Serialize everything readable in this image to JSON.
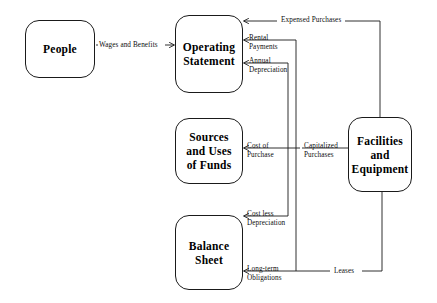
{
  "diagram": {
    "type": "flow-diagram",
    "canvas": {
      "width": 437,
      "height": 303,
      "background": "#ffffff"
    },
    "stroke_color": "#1a1a1a",
    "nodes": [
      {
        "id": "people",
        "lines": [
          "People"
        ],
        "x": 25,
        "y": 20,
        "w": 70,
        "h": 58
      },
      {
        "id": "operating-statement",
        "lines": [
          "Operating",
          "Statement"
        ],
        "x": 175,
        "y": 15,
        "w": 68,
        "h": 78
      },
      {
        "id": "sources-and-uses-of-funds",
        "lines": [
          "Sources",
          "and Uses",
          "of Funds"
        ],
        "x": 175,
        "y": 118,
        "w": 68,
        "h": 66
      },
      {
        "id": "balance-sheet",
        "lines": [
          "Balance",
          "Sheet"
        ],
        "x": 175,
        "y": 215,
        "w": 68,
        "h": 75
      },
      {
        "id": "facilities-and-equipment",
        "lines": [
          "Facilities",
          "and",
          "Equipment"
        ],
        "x": 348,
        "y": 117,
        "w": 64,
        "h": 75
      }
    ],
    "edges": [
      {
        "id": "wages-and-benefits",
        "label_lines": [
          "Wages and Benefits"
        ],
        "from": "people",
        "to": "operating-statement",
        "label_x": 99,
        "label_y": 41,
        "align": "left"
      },
      {
        "id": "expensed-purchases",
        "label_lines": [
          "Expensed Purchases"
        ],
        "from": "facilities-and-equipment",
        "to": "operating-statement",
        "label_x": 281,
        "label_y": 20,
        "align": "left"
      },
      {
        "id": "rental-payments",
        "label_lines": [
          "Rental",
          "Payments"
        ],
        "from": "facilities-and-equipment",
        "to": "operating-statement",
        "label_x": 249,
        "label_y": 35,
        "align": "left"
      },
      {
        "id": "annual-depreciation",
        "label_lines": [
          "Annual",
          "Depreciation"
        ],
        "from": "facilities-and-equipment",
        "to": "operating-statement",
        "label_x": 249,
        "label_y": 58,
        "align": "left"
      },
      {
        "id": "cost-of-purchase",
        "label_lines": [
          "Cost of",
          "Purchase"
        ],
        "from": "facilities-and-equipment",
        "to": "sources-and-uses-of-funds",
        "label_x": 247,
        "label_y": 143,
        "align": "left"
      },
      {
        "id": "capitalized-purchases",
        "label_lines": [
          "Capitalized",
          "Purchases"
        ],
        "from": "facilities-and-equipment",
        "to": "sources-and-uses-of-funds",
        "label_x": 304,
        "label_y": 143,
        "align": "left"
      },
      {
        "id": "cost-less-depreciation",
        "label_lines": [
          "Cost less",
          "Depreciation"
        ],
        "from": "facilities-and-equipment",
        "to": "balance-sheet",
        "label_x": 247,
        "label_y": 211,
        "align": "left"
      },
      {
        "id": "long-term-obligations",
        "label_lines": [
          "Long-term",
          "Obligations"
        ],
        "from": "facilities-and-equipment",
        "to": "balance-sheet",
        "label_x": 247,
        "label_y": 266,
        "align": "left"
      },
      {
        "id": "leases",
        "label_lines": [
          "Leases"
        ],
        "from": "facilities-and-equipment",
        "to": "balance-sheet",
        "label_x": 334,
        "label_y": 267,
        "align": "left"
      }
    ]
  }
}
